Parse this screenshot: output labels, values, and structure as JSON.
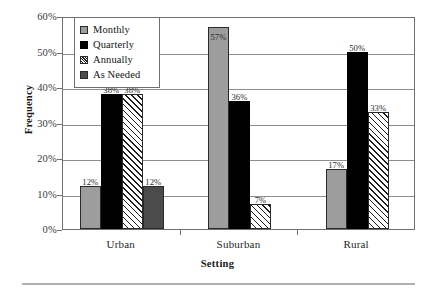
{
  "chart_data": {
    "type": "bar",
    "title": "",
    "subtitle": "",
    "xlabel": "Setting",
    "ylabel": "Frequency",
    "categories": [
      "Urban",
      "Suburban",
      "Rural"
    ],
    "ylim": [
      0,
      60
    ],
    "ytick_labels": [
      "0%",
      "10%",
      "20%",
      "30%",
      "40%",
      "50%",
      "60%"
    ],
    "ytick_values": [
      0,
      10,
      20,
      30,
      40,
      50,
      60
    ],
    "grid": true,
    "legend_position": "top-left-inside",
    "series": [
      {
        "name": "Monthly",
        "swatch": "monthly",
        "color": "#9d9d9d",
        "values": [
          12,
          57,
          17
        ],
        "labels": [
          "12%",
          "57%",
          "17%"
        ]
      },
      {
        "name": "Quarterly",
        "swatch": "quarterly",
        "color": "#000000",
        "values": [
          38,
          36,
          50
        ],
        "labels": [
          "38%",
          "36%",
          "50%"
        ]
      },
      {
        "name": "Annually",
        "swatch": "annually",
        "color": "#ffffff",
        "values": [
          38,
          7,
          33
        ],
        "labels": [
          "38%",
          "7%",
          "33%"
        ]
      },
      {
        "name": "As Needed",
        "swatch": "asneeded",
        "color": "#4b4b4b",
        "values": [
          12,
          null,
          null
        ],
        "labels": [
          "12%",
          "",
          ""
        ]
      }
    ]
  },
  "legend": {
    "items": [
      {
        "label": "Monthly"
      },
      {
        "label": "Quarterly"
      },
      {
        "label": "Annually"
      },
      {
        "label": "As Needed"
      }
    ]
  },
  "axes": {
    "y_title": "Frequency",
    "x_title": "Setting"
  }
}
